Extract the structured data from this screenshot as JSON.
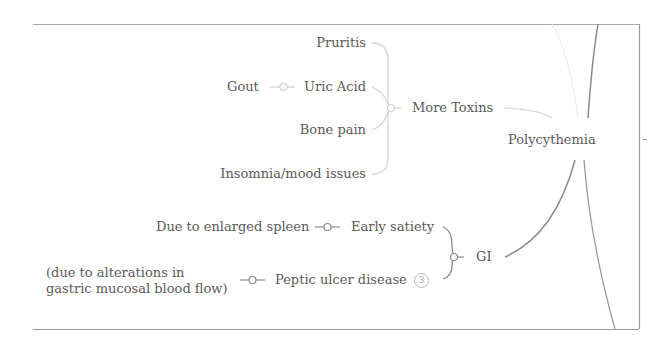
{
  "mindmap": {
    "root": {
      "label": "Polycythemia"
    },
    "branches": [
      {
        "label": "More Toxins",
        "children": [
          {
            "label": "Pruritis"
          },
          {
            "label": "Uric Acid",
            "children": [
              {
                "label": "Gout"
              }
            ]
          },
          {
            "label": "Bone pain"
          },
          {
            "label": "Insomnia/mood issues"
          }
        ]
      },
      {
        "label": "GI",
        "children": [
          {
            "label": "Early satiety",
            "children": [
              {
                "label": "Due to enlarged spleen"
              }
            ]
          },
          {
            "label": "Peptic ulcer disease",
            "badge": "3",
            "children": [
              {
                "label": "(due to alterations in gastric mucosal blood flow)"
              }
            ]
          }
        ]
      }
    ]
  },
  "colors": {
    "frame": "#9a9a9a",
    "branch_light": "#d8d8d8",
    "branch_dark": "#9a9a9a",
    "text": "#5a5a5a"
  }
}
